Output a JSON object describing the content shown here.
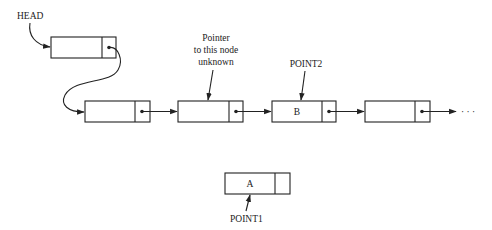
{
  "diagram": {
    "type": "linked-list",
    "labels": {
      "head": "HEAD",
      "unknown_pointer_line1": "Pointer",
      "unknown_pointer_line2": "to this node",
      "unknown_pointer_line3": "unknown",
      "point2": "POINT2",
      "point1": "POINT1",
      "continuation": "· · ·"
    },
    "nodes": [
      {
        "id": "head-node",
        "value": ""
      },
      {
        "id": "node-1",
        "value": ""
      },
      {
        "id": "node-2",
        "value": ""
      },
      {
        "id": "node-3",
        "value": "B"
      },
      {
        "id": "node-4",
        "value": ""
      },
      {
        "id": "node-a",
        "value": "A"
      }
    ],
    "colors": {
      "stroke": "#222222",
      "background": "#ffffff"
    }
  }
}
